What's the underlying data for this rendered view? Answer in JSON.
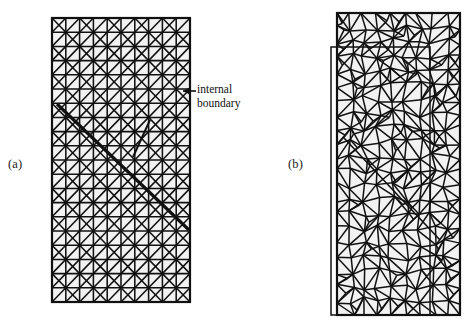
{
  "figure": {
    "type": "mesh-comparison-diagram",
    "background_color": "#ffffff",
    "line_color": "#111111",
    "fill_color": "#f2f2f2"
  },
  "panels": [
    {
      "id": "a",
      "label": "(a)",
      "label_position": {
        "x": 8,
        "y": 157
      },
      "mesh_type": "structured-triangular",
      "description": "Rectangular domain meshed with a regular right-triangle grid, crossed by a thick internal boundary line",
      "rect": {
        "x": 52,
        "y": 18,
        "width": 138,
        "height": 284
      },
      "columns": 10,
      "rows": 20,
      "internal_boundary": {
        "main_segment": {
          "x1": 57,
          "y1": 104,
          "x2": 189,
          "y2": 230
        },
        "branch_segment": {
          "x1": 150,
          "y1": 120,
          "x2": 133,
          "y2": 157
        },
        "stroke_width": 3.2
      }
    },
    {
      "id": "b",
      "label": "(b)",
      "label_position": {
        "x": 288,
        "y": 157
      },
      "mesh_type": "unstructured-triangular",
      "description": "Rectangular domain remeshed with an unstructured triangulation aligned to the internal boundary; an offset inner frame is visible",
      "rect": {
        "x": 337,
        "y": 13,
        "width": 123,
        "height": 302
      },
      "inner_frame": {
        "x": 331,
        "y": 47,
        "width": 99,
        "height": 268
      },
      "columns": 9,
      "rows": 21,
      "internal_boundary": {
        "main_segment": {
          "x1": 344,
          "y1": 138,
          "x2": 440,
          "y2": 240
        },
        "stroke_width": 1.6
      }
    }
  ],
  "annotations": [
    {
      "id": "internal-boundary",
      "lines": [
        "internal",
        "boundary"
      ],
      "text_position": {
        "x": 197,
        "y": 83
      },
      "leader": {
        "from": {
          "x": 196,
          "y": 91
        },
        "to": {
          "x": 183,
          "y": 91
        },
        "arrowhead": "left"
      }
    }
  ]
}
